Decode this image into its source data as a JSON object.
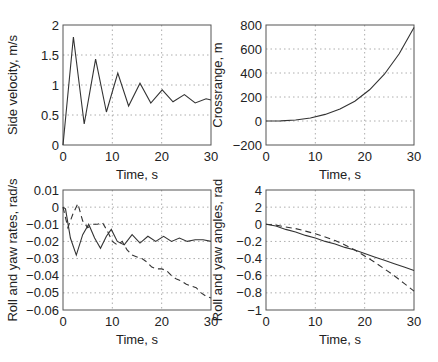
{
  "chart_data": [
    {
      "type": "line",
      "title": "",
      "xlabel": "Time, s",
      "ylabel": "Side velocity, m/s",
      "xlim": [
        0,
        30
      ],
      "ylim": [
        0,
        2
      ],
      "xticks": [
        0,
        10,
        20,
        30
      ],
      "yticks": [
        0,
        0.5,
        1,
        1.5,
        2
      ],
      "ytick_labels": [
        "0",
        "0.5",
        "1",
        "1.5",
        "2"
      ],
      "grid": true,
      "series": [
        {
          "name": "side velocity",
          "style": "solid",
          "x": [
            0,
            2.1,
            4.3,
            6.6,
            8.8,
            11.1,
            13.3,
            15.6,
            17.8,
            20.1,
            22.3,
            24.6,
            26.8,
            29,
            30
          ],
          "y": [
            0,
            1.8,
            0.35,
            1.43,
            0.55,
            1.2,
            0.65,
            1.03,
            0.7,
            0.92,
            0.72,
            0.84,
            0.7,
            0.77,
            0.75
          ]
        }
      ]
    },
    {
      "type": "line",
      "title": "",
      "xlabel": "Time, s",
      "ylabel": "Crossrange, m",
      "xlim": [
        0,
        30
      ],
      "ylim": [
        -200,
        800
      ],
      "xticks": [
        0,
        10,
        20,
        30
      ],
      "yticks": [
        -200,
        0,
        200,
        400,
        600,
        800
      ],
      "ytick_labels": [
        "−200",
        "0",
        "200",
        "400",
        "600",
        "800"
      ],
      "grid": true,
      "series": [
        {
          "name": "crossrange",
          "style": "solid",
          "x": [
            0,
            3,
            6,
            9,
            12,
            15,
            18,
            21,
            24,
            27,
            30
          ],
          "y": [
            0,
            1,
            8,
            25,
            55,
            100,
            165,
            260,
            390,
            560,
            780
          ]
        }
      ]
    },
    {
      "type": "line",
      "title": "",
      "xlabel": "Time, s",
      "ylabel": "Roll and yaw rates, rad/s",
      "xlim": [
        0,
        30
      ],
      "ylim": [
        -0.06,
        0.01
      ],
      "xticks": [
        0,
        10,
        20,
        30
      ],
      "yticks": [
        -0.06,
        -0.05,
        -0.04,
        -0.03,
        -0.02,
        -0.01,
        0,
        0.01
      ],
      "ytick_labels": [
        "−0.06",
        "−0.05",
        "−0.04",
        "−0.03",
        "−0.02",
        "−0.01",
        "0",
        "0.01"
      ],
      "grid": true,
      "series": [
        {
          "name": "roll rate",
          "style": "solid",
          "x": [
            0,
            0.5,
            1.5,
            2.7,
            4,
            5.2,
            6.4,
            7.6,
            8.8,
            9.8,
            11,
            12.4,
            14,
            15.6,
            17.2,
            18.8,
            20.4,
            22,
            23.6,
            25.2,
            26.8,
            28.4,
            30
          ],
          "y": [
            0,
            -0.001,
            -0.018,
            -0.028,
            -0.016,
            -0.01,
            -0.018,
            -0.024,
            -0.017,
            -0.013,
            -0.02,
            -0.022,
            -0.016,
            -0.021,
            -0.017,
            -0.02,
            -0.017,
            -0.02,
            -0.018,
            -0.02,
            -0.019,
            -0.019,
            -0.02
          ]
        },
        {
          "name": "yaw rate",
          "style": "dashed",
          "x": [
            0,
            1,
            2,
            3,
            4,
            5,
            6,
            7,
            8,
            9,
            10,
            11,
            12,
            13,
            14,
            15,
            16,
            17,
            18,
            19,
            20,
            21,
            22,
            23,
            24,
            25,
            26,
            27,
            28,
            29,
            30
          ],
          "y": [
            0,
            -0.012,
            -0.004,
            0.002,
            -0.008,
            -0.012,
            -0.01,
            -0.01,
            -0.009,
            -0.014,
            -0.02,
            -0.022,
            -0.02,
            -0.025,
            -0.028,
            -0.029,
            -0.03,
            -0.032,
            -0.035,
            -0.036,
            -0.036,
            -0.037,
            -0.04,
            -0.042,
            -0.043,
            -0.045,
            -0.046,
            -0.047,
            -0.05,
            -0.052,
            -0.053
          ]
        }
      ]
    },
    {
      "type": "line",
      "title": "",
      "xlabel": "Time, s",
      "ylabel": "Roll and yaw angles, rad",
      "xlim": [
        0,
        30
      ],
      "ylim": [
        -1,
        0.4
      ],
      "xticks": [
        0,
        10,
        20,
        30
      ],
      "yticks": [
        -1,
        -0.8,
        -0.6,
        -0.4,
        -0.2,
        0,
        0.2,
        0.4
      ],
      "ytick_labels": [
        "−1",
        "−0.8",
        "−0.6",
        "−0.4",
        "−0.2",
        "0",
        "2",
        "4"
      ],
      "grid": true,
      "series": [
        {
          "name": "roll angle",
          "style": "solid",
          "x": [
            0,
            2,
            4,
            6,
            8,
            10,
            12,
            14,
            16,
            18,
            20,
            22,
            24,
            26,
            28,
            30
          ],
          "y": [
            0,
            -0.02,
            -0.06,
            -0.09,
            -0.13,
            -0.16,
            -0.2,
            -0.23,
            -0.27,
            -0.3,
            -0.34,
            -0.38,
            -0.42,
            -0.46,
            -0.5,
            -0.54
          ]
        },
        {
          "name": "yaw angle",
          "style": "dashed",
          "x": [
            0,
            2,
            4,
            6,
            8,
            10,
            12,
            14,
            16,
            18,
            20,
            22,
            24,
            26,
            28,
            30
          ],
          "y": [
            0,
            -0.01,
            -0.03,
            -0.05,
            -0.08,
            -0.11,
            -0.15,
            -0.19,
            -0.24,
            -0.3,
            -0.37,
            -0.44,
            -0.52,
            -0.6,
            -0.69,
            -0.78
          ]
        }
      ]
    }
  ],
  "caption_text": ""
}
